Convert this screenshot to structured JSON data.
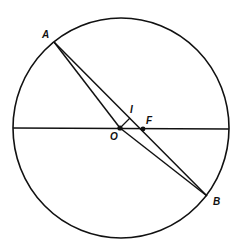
{
  "diagram": {
    "type": "geometry",
    "colors": {
      "stroke": "#111111",
      "background": "#ffffff"
    },
    "circle": {
      "cx": 121,
      "cy": 128,
      "rx": 108,
      "ry": 110
    },
    "diameter": {
      "x1": 13,
      "y1": 128,
      "x2": 229,
      "y2": 129
    },
    "points": {
      "A": {
        "label": "A",
        "x": 54,
        "y": 42,
        "label_x": 42,
        "label_y": 38
      },
      "B": {
        "label": "B",
        "x": 207,
        "y": 196,
        "label_x": 213,
        "label_y": 205
      },
      "O": {
        "label": "O",
        "x": 120,
        "y": 128,
        "label_x": 110,
        "label_y": 140
      },
      "F": {
        "label": "F",
        "x": 143,
        "y": 129,
        "label_x": 146,
        "label_y": 124
      },
      "I": {
        "label": "I",
        "x": 130,
        "y": 118,
        "label_x": 130,
        "label_y": 113
      }
    },
    "segments": [
      {
        "from": "A",
        "to": "B",
        "name": "chord-ab"
      },
      {
        "from": "A",
        "to": "O",
        "name": "segment-ao"
      },
      {
        "from": "O",
        "to": "B",
        "name": "segment-ob"
      },
      {
        "from": "O",
        "to": "I",
        "name": "segment-oi"
      }
    ]
  }
}
